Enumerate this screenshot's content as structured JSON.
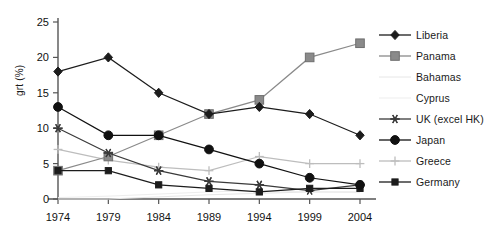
{
  "chart_data": {
    "type": "line",
    "title": "",
    "xlabel": "",
    "ylabel": "grt (%)",
    "categories": [
      "1974",
      "1979",
      "1984",
      "1989",
      "1994",
      "1999",
      "2004"
    ],
    "ylim": [
      0,
      25
    ],
    "yticks": [
      0,
      5,
      10,
      15,
      20,
      25
    ],
    "grid": false,
    "legend_position": "right",
    "series": [
      {
        "name": "Liberia",
        "marker": "diamond",
        "color": "#1c1c1c",
        "values": [
          18,
          20,
          15,
          12,
          13,
          12,
          9
        ]
      },
      {
        "name": "Panama",
        "marker": "square-gray",
        "color": "#8a8a8a",
        "values": [
          4,
          6,
          9,
          12,
          14,
          20,
          22
        ]
      },
      {
        "name": "Bahamas",
        "marker": "none",
        "color": "#e6e6e6",
        "values": [
          0,
          0,
          0.3,
          0.6,
          0.8,
          1,
          1
        ]
      },
      {
        "name": "Cyprus",
        "marker": "none",
        "color": "#ededed",
        "values": [
          0.2,
          0.4,
          0.7,
          1,
          1.2,
          1,
          0.9
        ]
      },
      {
        "name": "UK (excel HK)",
        "marker": "asterisk",
        "color": "#3a3a3a",
        "values": [
          10,
          6.5,
          4,
          2.5,
          2,
          1.2,
          2
        ]
      },
      {
        "name": "Japan",
        "marker": "circle",
        "color": "#111111",
        "values": [
          13,
          9,
          9,
          7,
          5,
          3,
          2
        ]
      },
      {
        "name": "Greece",
        "marker": "plus-light",
        "color": "#bdbdbd",
        "values": [
          7,
          5.5,
          4.5,
          4,
          6,
          5,
          5
        ]
      },
      {
        "name": "Germany",
        "marker": "square-small",
        "color": "#1c1c1c",
        "values": [
          4,
          4,
          2,
          1.5,
          1,
          1.5,
          1.5
        ]
      }
    ]
  },
  "axes": {
    "y_tick_labels": [
      "25",
      "20",
      "15",
      "10",
      "5",
      "0"
    ],
    "x_tick_labels": [
      "1974",
      "1979",
      "1984",
      "1989",
      "1994",
      "1999",
      "2004"
    ],
    "y_axis_title": "grt (%)"
  },
  "legend": {
    "items": [
      {
        "label": "Liberia"
      },
      {
        "label": "Panama"
      },
      {
        "label": "Bahamas"
      },
      {
        "label": "Cyprus"
      },
      {
        "label": "UK (excel HK)"
      },
      {
        "label": "Japan"
      },
      {
        "label": "Greece"
      },
      {
        "label": "Germany"
      }
    ]
  }
}
